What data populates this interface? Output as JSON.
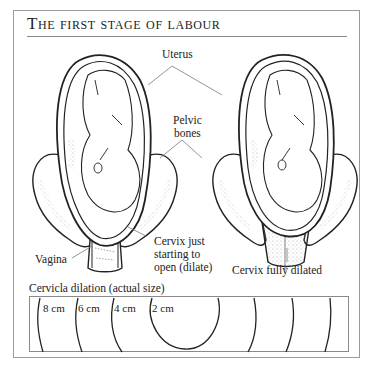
{
  "title": "The first stage of labour",
  "labels": {
    "uterus": "Uterus",
    "pelvic_bones_line1": "Pelvic",
    "pelvic_bones_line2": "bones",
    "vagina": "Vagina",
    "cervix_just_line1": "Cervix just",
    "cervix_just_line2": "starting to",
    "cervix_just_line3": "open (dilate)",
    "cervix_full": "Cervix fully dilated"
  },
  "dilation": {
    "title": "Cervicla dilation (actual size)",
    "rings": [
      {
        "label": "8 cm"
      },
      {
        "label": "6 cm"
      },
      {
        "label": "4 cm"
      },
      {
        "label": "2 cm"
      }
    ]
  },
  "colors": {
    "ink": "#222222",
    "frame": "#9a9a9a",
    "leader": "#7a7a7a",
    "stipple": "#999999"
  }
}
